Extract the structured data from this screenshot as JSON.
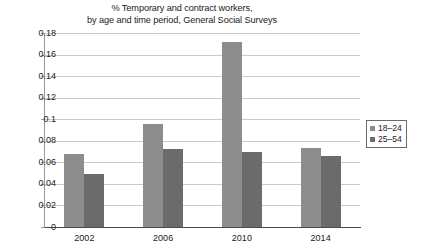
{
  "chart_data": {
    "type": "bar",
    "title": "% Temporary and contract workers, by age and time period, General Social Surveys",
    "title_lines": [
      "% Temporary and contract workers,",
      "by age and time period, General Social Surveys"
    ],
    "xlabel": "",
    "ylabel": "",
    "categories": [
      "2002",
      "2006",
      "2010",
      "2014"
    ],
    "series": [
      {
        "name": "18–24",
        "color": "#8d8d8d",
        "values": [
          0.068,
          0.096,
          0.172,
          0.073
        ]
      },
      {
        "name": "25–54",
        "color": "#6b6b6b",
        "values": [
          0.049,
          0.072,
          0.07,
          0.066
        ]
      }
    ],
    "ylim": [
      0,
      0.18
    ],
    "ytick_values": [
      0,
      0.02,
      0.04,
      0.06,
      0.08,
      0.1,
      0.12,
      0.14,
      0.16,
      0.18
    ],
    "ytick_labels": [
      "0",
      "0.02",
      "0.04",
      "0.06",
      "0.08",
      "0.1",
      "0.12",
      "0.14",
      "0.16",
      "0.18"
    ],
    "grid": true,
    "grid_axis": "y",
    "legend_position": "right",
    "legend_entries": [
      "18–24",
      "25–54"
    ],
    "background_color": "#ffffff",
    "grid_color": "#c9c9c9",
    "axis_color": "#9a9a9a"
  }
}
